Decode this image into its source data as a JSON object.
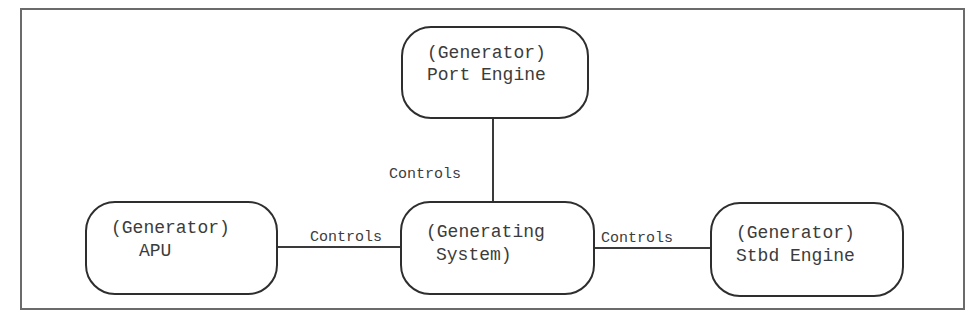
{
  "diagram": {
    "type": "relationship-diagram",
    "nodes": [
      {
        "id": "port-engine",
        "line1": "(Generator)",
        "line2": "Port Engine"
      },
      {
        "id": "generating-system",
        "line1": "(Generating",
        "line2": "System)"
      },
      {
        "id": "apu",
        "line1": "(Generator)",
        "line2": "APU"
      },
      {
        "id": "stbd-engine",
        "line1": "(Generator)",
        "line2": "Stbd Engine"
      }
    ],
    "edges": [
      {
        "from": "generating-system",
        "to": "port-engine",
        "label": "Controls"
      },
      {
        "from": "generating-system",
        "to": "apu",
        "label": "Controls"
      },
      {
        "from": "generating-system",
        "to": "stbd-engine",
        "label": "Controls"
      }
    ]
  },
  "colors": {
    "stroke": "#2e2e2e",
    "frame": "#6b6b6b",
    "text": "#3c3c3c",
    "background": "#ffffff"
  }
}
